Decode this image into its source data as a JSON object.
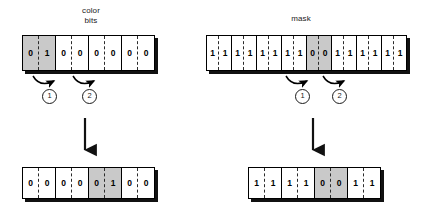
{
  "diagram": {
    "title_left": "color\nbits",
    "title_right": "mask",
    "step_labels": [
      "1",
      "2"
    ]
  },
  "arrays": {
    "color_bits_top": {
      "name": "color bits",
      "bit_count": 8,
      "group_size": 2,
      "bits": [
        "0",
        "1",
        "0",
        "0",
        "0",
        "0",
        "0",
        "0"
      ],
      "shaded_groups": [
        0
      ]
    },
    "mask_top": {
      "name": "mask",
      "bit_count": 16,
      "group_size": 2,
      "bits": [
        "1",
        "1",
        "1",
        "1",
        "1",
        "1",
        "1",
        "1",
        "0",
        "0",
        "1",
        "1",
        "1",
        "1",
        "1",
        "1"
      ],
      "shaded_groups": [
        4
      ]
    },
    "color_bits_bottom": {
      "name": "color bits shifted",
      "bit_count": 8,
      "group_size": 2,
      "bits": [
        "0",
        "0",
        "0",
        "0",
        "0",
        "1",
        "0",
        "0"
      ],
      "shaded_groups": [
        2
      ]
    },
    "mask_bottom": {
      "name": "mask shifted",
      "bit_count": 8,
      "group_size": 2,
      "bits": [
        "1",
        "1",
        "1",
        "1",
        "0",
        "0",
        "1",
        "1"
      ],
      "shaded_groups": [
        2
      ]
    }
  },
  "colors": {
    "shade": "#c9c9c9",
    "line": "#000000",
    "shadow": "#111111",
    "background": "#ffffff"
  }
}
